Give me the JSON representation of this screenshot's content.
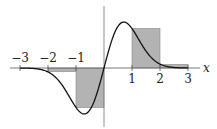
{
  "chart_data": {
    "type": "area",
    "title": "",
    "xlabel": "x",
    "ylabel": "",
    "x_ticks": [
      "-3",
      "-2",
      "-1",
      "1",
      "2",
      "3"
    ],
    "xlim": [
      -3,
      3
    ],
    "ylim": [
      -1,
      1
    ],
    "curve": {
      "name": "f(x)",
      "description": "odd smooth function, approx 2.33*x*exp(-x^2)",
      "x": [
        -3,
        -2.5,
        -2,
        -1.5,
        -1,
        -0.7,
        -0.5,
        0,
        0.5,
        0.7,
        1,
        1.5,
        2,
        2.5,
        3
      ],
      "y": [
        0,
        -0.01,
        -0.09,
        -0.37,
        -0.86,
        -1.0,
        -0.91,
        0,
        0.91,
        1.0,
        0.86,
        0.37,
        0.09,
        0.01,
        0
      ]
    },
    "step_rectangles": [
      {
        "x0": -2,
        "x1": -1,
        "height": -0.08
      },
      {
        "x0": -1,
        "x1": 0,
        "height": -0.86
      },
      {
        "x0": 1,
        "x1": 2,
        "height": 0.86
      },
      {
        "x0": 2,
        "x1": 3,
        "height": 0.08
      }
    ],
    "colors": {
      "rect_fill": "#b3b3b3",
      "rect_stroke": "#8a8a8a",
      "curve": "#111111",
      "axis": "#555555"
    },
    "grid": false,
    "legend": null
  }
}
